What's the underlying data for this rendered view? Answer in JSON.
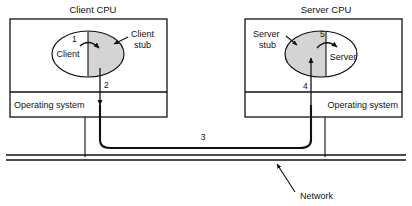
{
  "figure": {
    "type": "diagram"
  },
  "client_cpu": {
    "title": "Client CPU",
    "os_label": "Operating system",
    "ellipse": {
      "inner_label": "Client",
      "stub_label_line1": "Client",
      "stub_label_line2": "stub",
      "shaded_side": "right",
      "shade_color": "#d4d4d4"
    },
    "steps": {
      "call": "1",
      "to_os": "2"
    }
  },
  "server_cpu": {
    "title": "Server CPU",
    "os_label": "Operating system",
    "ellipse": {
      "inner_label": "Server",
      "stub_label_line1": "Server",
      "stub_label_line2": "stub",
      "shaded_side": "left",
      "shade_color": "#d4d4d4"
    },
    "steps": {
      "from_os": "4",
      "call": "5"
    }
  },
  "network": {
    "label": "Network",
    "message_step": "3"
  },
  "colors": {
    "stroke": "#111111",
    "background": "#ffffff",
    "shade": "#d4d4d4"
  }
}
